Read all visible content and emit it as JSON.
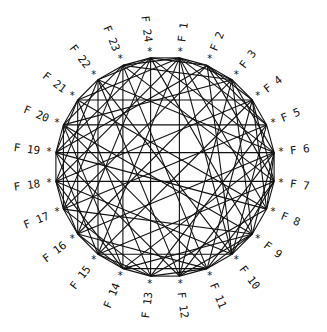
{
  "diagram": {
    "type": "circular-graph",
    "node_count": 24,
    "center": [
      165,
      167
    ],
    "vertex_radius": 110,
    "marker_radius": 117,
    "label_radius": 126,
    "first_node_angle_deg": -82.5,
    "angle_step_deg": 15,
    "marker_glyph": "*",
    "line_color": "#111111",
    "background": "#ffffff",
    "nodes": [
      {
        "id": 1,
        "label": "F 1"
      },
      {
        "id": 2,
        "label": "F 2"
      },
      {
        "id": 3,
        "label": "F 3"
      },
      {
        "id": 4,
        "label": "F 4"
      },
      {
        "id": 5,
        "label": "F 5"
      },
      {
        "id": 6,
        "label": "F 6"
      },
      {
        "id": 7,
        "label": "F 7"
      },
      {
        "id": 8,
        "label": "F 8"
      },
      {
        "id": 9,
        "label": "F 9"
      },
      {
        "id": 10,
        "label": "F 10"
      },
      {
        "id": 11,
        "label": "F 11"
      },
      {
        "id": 12,
        "label": "F 12"
      },
      {
        "id": 13,
        "label": "F 13"
      },
      {
        "id": 14,
        "label": "F 14"
      },
      {
        "id": 15,
        "label": "F 15"
      },
      {
        "id": 16,
        "label": "F 16"
      },
      {
        "id": 17,
        "label": "F 17"
      },
      {
        "id": 18,
        "label": "F 18"
      },
      {
        "id": 19,
        "label": "F 19"
      },
      {
        "id": 20,
        "label": "F 20"
      },
      {
        "id": 21,
        "label": "F 21"
      },
      {
        "id": 22,
        "label": "F 22"
      },
      {
        "id": 23,
        "label": "F 23"
      },
      {
        "id": 24,
        "label": "F 24"
      }
    ],
    "edges": [
      [
        1,
        2
      ],
      [
        2,
        3
      ],
      [
        3,
        4
      ],
      [
        4,
        5
      ],
      [
        5,
        6
      ],
      [
        6,
        7
      ],
      [
        7,
        8
      ],
      [
        8,
        9
      ],
      [
        9,
        10
      ],
      [
        10,
        11
      ],
      [
        11,
        12
      ],
      [
        12,
        13
      ],
      [
        13,
        14
      ],
      [
        14,
        15
      ],
      [
        15,
        16
      ],
      [
        16,
        17
      ],
      [
        17,
        18
      ],
      [
        18,
        19
      ],
      [
        19,
        20
      ],
      [
        20,
        21
      ],
      [
        21,
        22
      ],
      [
        22,
        23
      ],
      [
        23,
        24
      ],
      [
        24,
        1
      ],
      [
        21,
        4
      ],
      [
        20,
        5
      ],
      [
        19,
        6
      ],
      [
        18,
        7
      ],
      [
        24,
        13
      ],
      [
        1,
        12
      ],
      [
        23,
        14
      ],
      [
        22,
        15
      ],
      [
        1,
        3
      ],
      [
        1,
        5
      ],
      [
        1,
        8
      ],
      [
        1,
        10
      ],
      [
        1,
        15
      ],
      [
        1,
        18
      ],
      [
        1,
        21
      ],
      [
        1,
        23
      ],
      [
        24,
        2
      ],
      [
        24,
        6
      ],
      [
        24,
        9
      ],
      [
        24,
        16
      ],
      [
        24,
        19
      ],
      [
        24,
        22
      ],
      [
        23,
        3
      ],
      [
        23,
        7
      ],
      [
        23,
        11
      ],
      [
        23,
        17
      ],
      [
        23,
        20
      ],
      [
        22,
        6
      ],
      [
        22,
        10
      ],
      [
        22,
        12
      ],
      [
        22,
        18
      ],
      [
        21,
        8
      ],
      [
        21,
        13
      ],
      [
        21,
        16
      ],
      [
        21,
        19
      ],
      [
        20,
        3
      ],
      [
        20,
        9
      ],
      [
        20,
        11
      ],
      [
        20,
        14
      ],
      [
        20,
        17
      ],
      [
        19,
        2
      ],
      [
        19,
        8
      ],
      [
        19,
        12
      ],
      [
        19,
        15
      ],
      [
        18,
        4
      ],
      [
        18,
        10
      ],
      [
        18,
        14
      ],
      [
        18,
        16
      ],
      [
        17,
        5
      ],
      [
        17,
        9
      ],
      [
        17,
        13
      ],
      [
        17,
        2
      ],
      [
        16,
        3
      ],
      [
        16,
        6
      ],
      [
        16,
        11
      ],
      [
        16,
        14
      ],
      [
        15,
        4
      ],
      [
        15,
        7
      ],
      [
        15,
        10
      ],
      [
        15,
        13
      ],
      [
        14,
        6
      ],
      [
        14,
        9
      ],
      [
        14,
        11
      ],
      [
        13,
        5
      ],
      [
        13,
        8
      ],
      [
        13,
        11
      ],
      [
        12,
        3
      ],
      [
        12,
        6
      ],
      [
        12,
        9
      ],
      [
        11,
        4
      ],
      [
        11,
        7
      ],
      [
        11,
        9
      ],
      [
        10,
        2
      ],
      [
        10,
        5
      ],
      [
        10,
        7
      ],
      [
        9,
        3
      ],
      [
        9,
        6
      ],
      [
        8,
        4
      ],
      [
        8,
        6
      ],
      [
        7,
        2
      ],
      [
        7,
        4
      ],
      [
        6,
        3
      ],
      [
        5,
        2
      ],
      [
        4,
        2
      ]
    ]
  }
}
